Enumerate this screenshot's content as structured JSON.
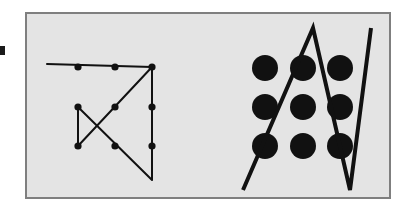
{
  "figure": {
    "canvas": {
      "width": 407,
      "height": 212,
      "background": "#ffffff"
    },
    "frame": {
      "x": 26,
      "y": 13,
      "width": 364,
      "height": 185,
      "fill": "#e4e4e4",
      "stroke": "#7f7f7f",
      "stroke_width": 2
    },
    "edge_mark": {
      "x": 0,
      "y": 46,
      "width": 5,
      "height": 9,
      "fill": "#1a1a1a"
    },
    "colors": {
      "ink": "#111111",
      "panel": "#e4e4e4",
      "frame_border": "#7f7f7f",
      "page": "#ffffff"
    },
    "left_panel": {
      "name": "four-line-solution",
      "grid": {
        "columns_x": [
          78,
          115,
          152
        ],
        "rows_y": [
          67,
          107,
          146
        ],
        "dot_radius": 3.6,
        "dot_fill": "#111111"
      },
      "dots": [
        {
          "id": "L-r0c0",
          "cx": 78,
          "cy": 67
        },
        {
          "id": "L-r0c1",
          "cx": 115,
          "cy": 67
        },
        {
          "id": "L-r0c2",
          "cx": 152,
          "cy": 67
        },
        {
          "id": "L-r1c0",
          "cx": 78,
          "cy": 107
        },
        {
          "id": "L-r1c1",
          "cx": 115,
          "cy": 107
        },
        {
          "id": "L-r1c2",
          "cx": 152,
          "cy": 107
        },
        {
          "id": "L-r2c0",
          "cx": 78,
          "cy": 146
        },
        {
          "id": "L-r2c1",
          "cx": 115,
          "cy": 146
        },
        {
          "id": "L-r2c2",
          "cx": 152,
          "cy": 146
        }
      ],
      "path_points": "47,64 152,67 78,146 78,107 152,180 152,67",
      "path_stroke": "#111111",
      "path_stroke_width": 2,
      "segment_count": 4
    },
    "right_panel": {
      "name": "zigzag-three-line-solution",
      "grid": {
        "columns_x": [
          265,
          303,
          340
        ],
        "rows_y": [
          68,
          107,
          146
        ],
        "dot_radius": 13,
        "dot_fill": "#111111"
      },
      "dots": [
        {
          "id": "R-r0c0",
          "cx": 265,
          "cy": 68
        },
        {
          "id": "R-r0c1",
          "cx": 303,
          "cy": 68
        },
        {
          "id": "R-r0c2",
          "cx": 340,
          "cy": 68
        },
        {
          "id": "R-r1c0",
          "cx": 265,
          "cy": 107
        },
        {
          "id": "R-r1c1",
          "cx": 303,
          "cy": 107
        },
        {
          "id": "R-r1c2",
          "cx": 340,
          "cy": 107
        },
        {
          "id": "R-r2c0",
          "cx": 265,
          "cy": 146
        },
        {
          "id": "R-r2c1",
          "cx": 303,
          "cy": 146
        },
        {
          "id": "R-r2c2",
          "cx": 340,
          "cy": 146
        }
      ],
      "path_points": "243,190 313,28 350,190 371,28",
      "path_stroke": "#111111",
      "path_stroke_width": 4,
      "segment_count": 3
    }
  }
}
